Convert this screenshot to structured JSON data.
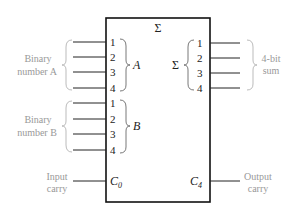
{
  "diagram": {
    "title_symbol": "Σ",
    "inputs": {
      "a": {
        "group_label_line1": "Binary",
        "group_label_line2": "number A",
        "bus_name": "A",
        "pins": [
          "1",
          "2",
          "3",
          "4"
        ]
      },
      "b": {
        "group_label_line1": "Binary",
        "group_label_line2": "number B",
        "bus_name": "B",
        "pins": [
          "1",
          "2",
          "3",
          "4"
        ]
      },
      "carry_in": {
        "label_line1": "Input",
        "label_line2": "carry",
        "pin": "C",
        "pin_sub": "0"
      }
    },
    "outputs": {
      "sum": {
        "bus_name": "Σ",
        "group_label_line1": "4-bit",
        "group_label_line2": "sum",
        "pins": [
          "1",
          "2",
          "3",
          "4"
        ]
      },
      "carry_out": {
        "label_line1": "Output",
        "label_line2": "carry",
        "pin": "C",
        "pin_sub": "4"
      }
    }
  }
}
